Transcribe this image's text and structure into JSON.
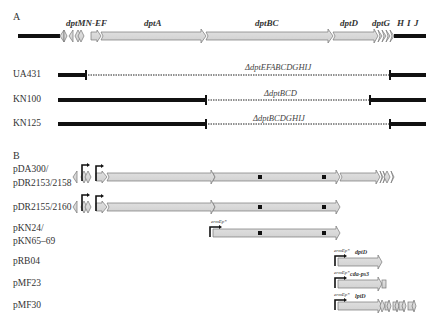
{
  "panel_a": {
    "label": "A",
    "gene_labels": [
      "dptMN-EF",
      "dptA",
      "dptBC",
      "dptD",
      "dptG",
      "H",
      "I",
      "J"
    ],
    "strains": [
      {
        "name": "UA431",
        "deletion": "ΔdptEFABCDGHIJ"
      },
      {
        "name": "KN100",
        "deletion": "ΔdptBCD"
      },
      {
        "name": "KN125",
        "deletion": "ΔdptBCDGHIJ"
      }
    ]
  },
  "panel_b": {
    "label": "B",
    "constructs": [
      {
        "name_line1": "pDA300/",
        "name_line2": "pDR2153/2158"
      },
      {
        "name_line1": "pDR2155/2160"
      },
      {
        "name_line1": "pKN24/",
        "name_line2": "pKN65–69",
        "promoter": "ermEp*"
      },
      {
        "name_line1": "pRB04",
        "promoter": "ermEp*",
        "gene": "dptD"
      },
      {
        "name_line1": "pMF23",
        "promoter": "ermEp*",
        "gene": "cda-ps3"
      },
      {
        "name_line1": "pMF30",
        "promoter": "ermEp*",
        "gene": "lptD"
      }
    ]
  }
}
